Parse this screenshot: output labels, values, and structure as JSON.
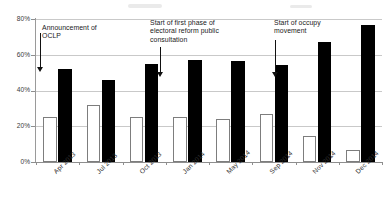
{
  "chart_data": {
    "type": "bar",
    "title": "",
    "subtitle": "",
    "xlabel": "",
    "ylabel": "",
    "ylim": [
      0,
      80
    ],
    "yticks": [
      0,
      20,
      40,
      60,
      80
    ],
    "ytick_labels": [
      "0%",
      "20%",
      "40%",
      "60%",
      "80%"
    ],
    "grid": true,
    "legend": "none",
    "categories": [
      "Apr 2013",
      "Jul 2013",
      "Oct 2013",
      "Jan 2014",
      "May 2014",
      "Sep 2014",
      "Nov 2014",
      "Dec 2014"
    ],
    "series": [
      {
        "name": "white-series",
        "color": "#ffffff",
        "edgecolor": "#7d7d7d",
        "values": [
          25,
          32,
          25,
          25,
          24,
          27,
          14.5,
          7
        ]
      },
      {
        "name": "black-series",
        "color": "#000000",
        "edgecolor": "#000000",
        "values": [
          52,
          46,
          55,
          57,
          56.5,
          54.5,
          67,
          76.5
        ]
      }
    ],
    "annotations": [
      {
        "id": "announcement-oclp",
        "text": "Announcement of\nOCLP",
        "arrow_target_category": "Apr 2013",
        "arrow_target_value": 46
      },
      {
        "id": "electoral-reform-consultation",
        "text": "Start of first phase of\nelectoral reform public\nconsultation",
        "arrow_target_category": "Oct 2013",
        "arrow_target_value": 46
      },
      {
        "id": "occupy-movement",
        "text": "Start of occupy\nmovement",
        "arrow_target_category": "Sep 2014",
        "arrow_target_value": 46
      }
    ]
  }
}
